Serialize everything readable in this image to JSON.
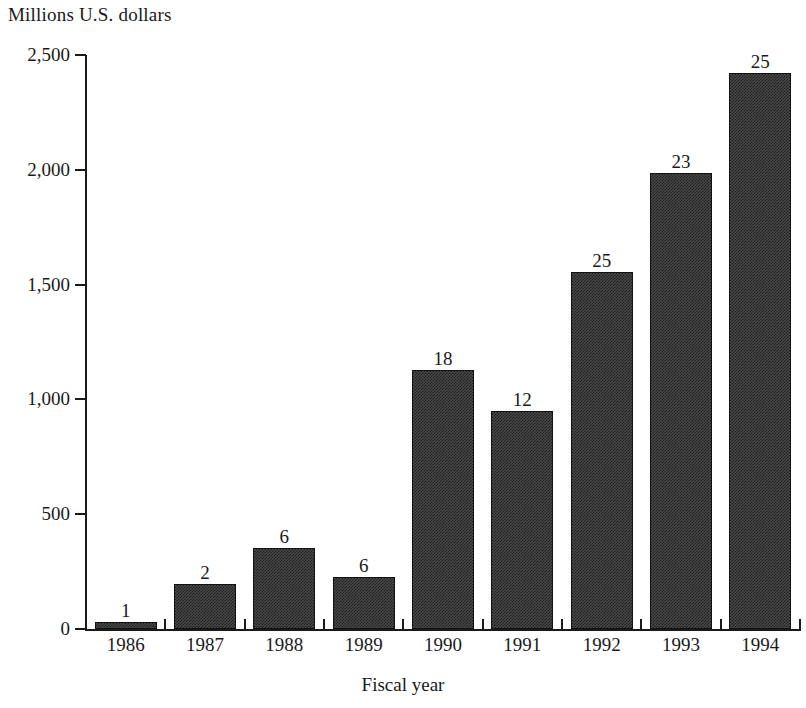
{
  "chart_data": {
    "type": "bar",
    "title": "",
    "ylabel": "Millions U.S. dollars",
    "xlabel": "Fiscal year",
    "categories": [
      "1986",
      "1987",
      "1988",
      "1989",
      "1990",
      "1991",
      "1992",
      "1993",
      "1994"
    ],
    "values": [
      30,
      195,
      355,
      225,
      1130,
      950,
      1555,
      1985,
      2420
    ],
    "point_labels": [
      "1",
      "2",
      "6",
      "6",
      "18",
      "12",
      "25",
      "23",
      "25"
    ],
    "ylim": [
      0,
      2500
    ],
    "y_ticks": [
      0,
      500,
      1000,
      1500,
      2000,
      2500
    ],
    "y_tick_labels": [
      "0",
      "500",
      "1,000",
      "1,500",
      "2,000",
      "2,500"
    ],
    "grid": false,
    "legend": "none",
    "bar_fill_color": "#4a4a4a",
    "bar_pattern_color": "#1c1c1c",
    "bar_border_color": "#111111",
    "axis_color": "#1a1a1a",
    "background_color": "#ffffff"
  },
  "axes": {
    "y_title": "Millions U.S. dollars",
    "x_title": "Fiscal year"
  }
}
